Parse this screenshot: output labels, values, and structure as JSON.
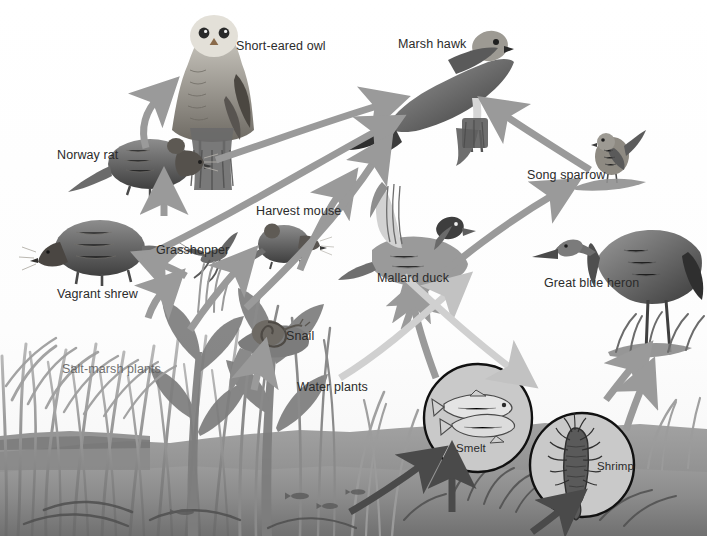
{
  "diagram": {
    "type": "food-web",
    "width": 707,
    "height": 536,
    "background_color": "#ffffff",
    "arrow_color": "#9a9a9a",
    "arrow_color_dark": "#4a4a4a",
    "water_color": "#8d8d8d",
    "sky_color": "#f2f2f2"
  },
  "organisms": [
    {
      "id": "short-eared-owl",
      "label": "Short-eared owl",
      "label_x": 236,
      "label_y": 40,
      "role": "predator"
    },
    {
      "id": "marsh-hawk",
      "label": "Marsh hawk",
      "label_x": 398,
      "label_y": 38,
      "role": "predator"
    },
    {
      "id": "norway-rat",
      "label": "Norway rat",
      "label_x": 57,
      "label_y": 149,
      "role": "consumer"
    },
    {
      "id": "song-sparrow",
      "label": "Song sparrow",
      "label_x": 527,
      "label_y": 169,
      "role": "consumer"
    },
    {
      "id": "harvest-mouse",
      "label": "Harvest mouse",
      "label_x": 256,
      "label_y": 205,
      "role": "consumer"
    },
    {
      "id": "grasshopper",
      "label": "Grasshopper",
      "label_x": 156,
      "label_y": 244,
      "role": "consumer"
    },
    {
      "id": "mallard-duck",
      "label": "Mallard duck",
      "label_x": 377,
      "label_y": 272,
      "role": "consumer"
    },
    {
      "id": "great-blue-heron",
      "label": "Great blue heron",
      "label_x": 544,
      "label_y": 277,
      "role": "predator"
    },
    {
      "id": "vagrant-shrew",
      "label": "Vagrant shrew",
      "label_x": 57,
      "label_y": 288,
      "role": "consumer"
    },
    {
      "id": "snail",
      "label": "Snail",
      "label_x": 286,
      "label_y": 330,
      "role": "consumer"
    },
    {
      "id": "salt-marsh-plants",
      "label": "Salt-marsh plants",
      "label_x": 62,
      "label_y": 363,
      "role": "producer"
    },
    {
      "id": "water-plants",
      "label": "Water plants",
      "label_x": 297,
      "label_y": 381,
      "role": "producer"
    },
    {
      "id": "smelt",
      "label": "Smelt",
      "label_x": 456,
      "label_y": 443,
      "role": "consumer"
    },
    {
      "id": "shrimp",
      "label": "Shrimp",
      "label_x": 597,
      "label_y": 461,
      "role": "consumer"
    }
  ],
  "inset_circles": [
    {
      "id": "smelt-circle",
      "cx": 478,
      "cy": 418,
      "r": 54
    },
    {
      "id": "shrimp-circle",
      "cx": 582,
      "cy": 465,
      "r": 52
    }
  ],
  "feeding_links": [
    {
      "from": "norway-rat",
      "to": "short-eared-owl"
    },
    {
      "from": "vagrant-shrew",
      "to": "norway-rat"
    },
    {
      "from": "grasshopper",
      "to": "vagrant-shrew"
    },
    {
      "from": "salt-marsh-plants",
      "to": "grasshopper"
    },
    {
      "from": "salt-marsh-plants",
      "to": "harvest-mouse"
    },
    {
      "from": "salt-marsh-plants",
      "to": "snail"
    },
    {
      "from": "salt-marsh-plants",
      "to": "song-sparrow"
    },
    {
      "from": "harvest-mouse",
      "to": "marsh-hawk"
    },
    {
      "from": "norway-rat",
      "to": "marsh-hawk"
    },
    {
      "from": "vagrant-shrew",
      "to": "marsh-hawk"
    },
    {
      "from": "mallard-duck",
      "to": "marsh-hawk"
    },
    {
      "from": "song-sparrow",
      "to": "marsh-hawk"
    },
    {
      "from": "water-plants",
      "to": "mallard-duck"
    },
    {
      "from": "water-plants",
      "to": "smelt"
    },
    {
      "from": "water-plants",
      "to": "shrimp"
    },
    {
      "from": "shrimp",
      "to": "mallard-duck"
    },
    {
      "from": "smelt",
      "to": "great-blue-heron"
    },
    {
      "from": "shrimp",
      "to": "great-blue-heron"
    }
  ]
}
